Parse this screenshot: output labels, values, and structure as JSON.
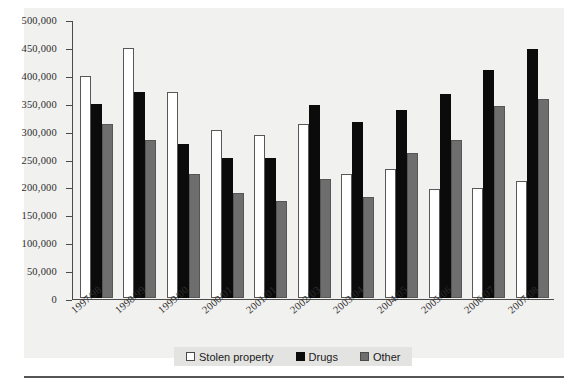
{
  "chart_data": {
    "type": "bar",
    "title": "",
    "subtitle": "",
    "xlabel": "",
    "ylabel": "",
    "ylim": [
      0,
      500000
    ],
    "ytick_labels": [
      "500,000",
      "450,000",
      "400,000",
      "350,000",
      "300,000",
      "250,000",
      "200,000",
      "150,000",
      "100,000",
      "50,000",
      "0"
    ],
    "ytick_values": [
      500000,
      450000,
      400000,
      350000,
      300000,
      250000,
      200000,
      150000,
      100000,
      50000,
      0
    ],
    "grid": false,
    "legend_position": "bottom-center",
    "categories": [
      "1997/98",
      "1998/99",
      "1999/00",
      "2000/01",
      "2001/01",
      "2002/03",
      "2003/04",
      "2004/05",
      "2005/06",
      "2006/07",
      "2007/08"
    ],
    "series": [
      {
        "name": "Stolen property",
        "color": "#ffffff",
        "values": [
          400000,
          450000,
          370000,
          302000,
          292000,
          313000,
          222000,
          231000,
          196000,
          197000,
          210000
        ]
      },
      {
        "name": "Drugs",
        "color": "#0b0b0b",
        "values": [
          349000,
          370000,
          277000,
          252000,
          251000,
          347000,
          317000,
          338000,
          367000,
          410000,
          447000
        ]
      },
      {
        "name": "Other",
        "color": "#6e6e6e",
        "values": [
          312000,
          283000,
          222000,
          188000,
          174000,
          213000,
          181000,
          261000,
          283000,
          345000,
          357000
        ]
      }
    ]
  },
  "legend": {
    "items": [
      {
        "label": "Stolen property",
        "swatch": "white-square-icon"
      },
      {
        "label": "Drugs",
        "swatch": "black-square-icon"
      },
      {
        "label": "Other",
        "swatch": "grey-square-icon"
      }
    ]
  },
  "colors": {
    "stolen_property": "#ffffff",
    "drugs": "#0b0b0b",
    "other": "#6e6e6e",
    "axis": "#4b4b4b",
    "panel_background": "#f1f1ef",
    "legend_background": "#e3e3e1"
  }
}
